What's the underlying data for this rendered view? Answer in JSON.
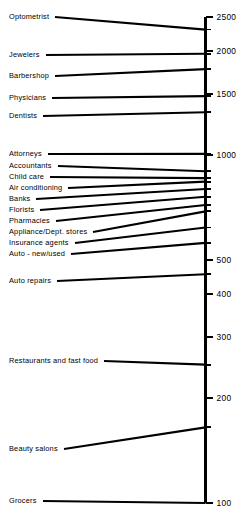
{
  "chart_data": {
    "type": "bar",
    "orientation": "horizontal-leader-lines",
    "title": "",
    "subtitle": "",
    "xlabel": "",
    "ylabel": "",
    "scale": "log",
    "axis": {
      "position": "right",
      "min": 100,
      "max": 2500,
      "grid": false,
      "tick_labels": [
        "2500",
        "2000",
        "1500",
        "1000",
        "500",
        "400",
        "300",
        "200",
        "100"
      ],
      "ticks": [
        2500,
        2000,
        1500,
        1000,
        500,
        400,
        300,
        200,
        100
      ],
      "minor_ticks": [
        2300,
        1960,
        1770,
        1480,
        1330,
        1010,
        900,
        860,
        840,
        800,
        760,
        720,
        690,
        620,
        560,
        455,
        250,
        165
      ]
    },
    "legend": {
      "visible": false,
      "entries": []
    },
    "categories": [
      "Optometrist",
      "Jewelers",
      "Barbershop",
      "Physicians",
      "Dentists",
      "Attorneys",
      "Accountants",
      "Child care",
      "Air conditioning",
      "Banks",
      "Florists",
      "Pharmacies",
      "Appliance/Dept. stores",
      "Insurance agents",
      "Auto - new/used",
      "Auto repairs",
      "Restaurants and fast food",
      "Beauty salons",
      "Grocers"
    ],
    "values": [
      2300,
      1960,
      1770,
      1480,
      1330,
      1010,
      900,
      860,
      840,
      800,
      760,
      720,
      690,
      620,
      560,
      455,
      250,
      165,
      100
    ],
    "items": [
      {
        "label": "Optometrist",
        "value": 2300,
        "label_y": 17,
        "axis_y": 27
      },
      {
        "label": "Jewelers",
        "value": 1960,
        "label_y": 55,
        "axis_y": 58
      },
      {
        "label": "Barbershop",
        "value": 1770,
        "label_y": 76,
        "axis_y": 78
      },
      {
        "label": "Physicians",
        "value": 1480,
        "label_y": 98,
        "axis_y": 100
      },
      {
        "label": "Dentists",
        "value": 1330,
        "label_y": 116,
        "axis_y": 118
      },
      {
        "label": "Attorneys",
        "value": 1010,
        "label_y": 154,
        "axis_y": 155
      },
      {
        "label": "Accountants",
        "value": 900,
        "label_y": 166,
        "axis_y": 174
      },
      {
        "label": "Child care",
        "value": 860,
        "label_y": 177,
        "axis_y": 181
      },
      {
        "label": "Air conditioning",
        "value": 840,
        "label_y": 188,
        "axis_y": 184
      },
      {
        "label": "Banks",
        "value": 800,
        "label_y": 199,
        "axis_y": 192
      },
      {
        "label": "Florists",
        "value": 760,
        "label_y": 210,
        "axis_y": 201
      },
      {
        "label": "Pharmacies",
        "value": 720,
        "label_y": 221,
        "axis_y": 210
      },
      {
        "label": "Appliance/Dept. stores",
        "value": 690,
        "label_y": 232,
        "axis_y": 217
      },
      {
        "label": "Insurance agents",
        "value": 620,
        "label_y": 243,
        "axis_y": 234
      },
      {
        "label": "Auto - new/used",
        "value": 560,
        "label_y": 254,
        "axis_y": 251
      },
      {
        "label": "Auto repairs",
        "value": 455,
        "label_y": 281,
        "axis_y": 281
      },
      {
        "label": "Restaurants and fast food",
        "value": 250,
        "label_y": 361,
        "axis_y": 361
      },
      {
        "label": "Beauty salons",
        "value": 165,
        "label_y": 449,
        "axis_y": 449
      },
      {
        "label": "Grocers",
        "value": 100,
        "label_y": 501,
        "axis_y": 503
      }
    ]
  },
  "colors": {
    "background": "#ffffff",
    "ink": "#000000",
    "axis": "#000000",
    "leader_line": "#000000"
  }
}
